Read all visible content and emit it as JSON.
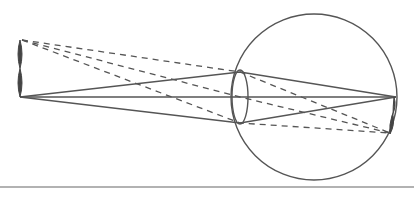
{
  "diagram": {
    "type": "optics-eye-ray-diagram",
    "colors": {
      "stroke": "#555555",
      "object": "#444444",
      "rule": "#999999",
      "background": "#ffffff"
    },
    "eyeball": {
      "cx": 314,
      "cy": 97,
      "r": 83
    },
    "lens": {
      "cx": 240,
      "cy": 97,
      "rx": 8,
      "ry": 27
    },
    "object": {
      "x": 20,
      "top": 40,
      "bottom": 97
    },
    "image": {
      "x": 392,
      "top": 97,
      "bottom": 134
    },
    "solid_rays": {
      "source": [
        20,
        97
      ],
      "focus": [
        396,
        97
      ],
      "via": [
        [
          240,
          72
        ],
        [
          240,
          97
        ],
        [
          240,
          123
        ]
      ]
    },
    "dashed_rays": {
      "source": [
        22,
        40
      ],
      "focus": [
        390,
        133
      ],
      "via": [
        [
          240,
          72
        ],
        [
          240,
          97
        ],
        [
          240,
          123
        ]
      ]
    },
    "rule_y": 187
  }
}
